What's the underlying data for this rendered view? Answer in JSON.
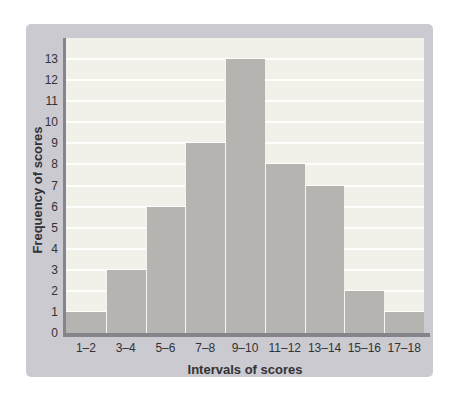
{
  "chart_data": {
    "type": "bar",
    "title": "",
    "categories": [
      "1–2",
      "3–4",
      "5–6",
      "7–8",
      "9–10",
      "11–12",
      "13–14",
      "15–16",
      "17–18"
    ],
    "values": [
      1,
      3,
      6,
      9,
      13,
      8,
      7,
      2,
      1
    ],
    "xlabel": "Intervals of scores",
    "ylabel": "Frequency of scores",
    "ylim": [
      0,
      14
    ],
    "yticks": [
      0,
      1,
      2,
      3,
      4,
      5,
      6,
      7,
      8,
      9,
      10,
      11,
      12,
      13
    ],
    "grid": "horizontal",
    "legend": "none"
  },
  "colors": {
    "page_bg": "#ffffff",
    "panel_bg": "#cbcad0",
    "plot_bg": "#f1f0e9",
    "bar": "#b5b4b1",
    "axis_line": "#84848a",
    "gridline": "#ffffff",
    "text": "#323236"
  }
}
